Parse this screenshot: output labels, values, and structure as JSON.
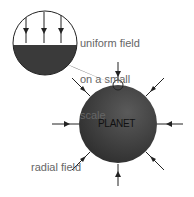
{
  "labels": {
    "uniform": [
      "uniform field",
      "on a small",
      "scale"
    ],
    "radial": [
      "radial field",
      "on a large",
      "scale"
    ],
    "planet": "PLANET"
  },
  "colors": {
    "planet": "#3a3a3a",
    "arrow": "#222222",
    "text": "#666666"
  }
}
